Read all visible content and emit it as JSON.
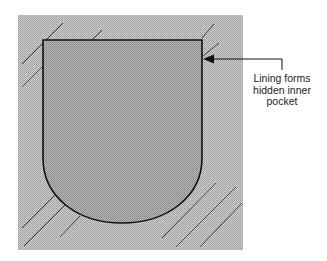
{
  "diagram": {
    "type": "pocket-cross-section",
    "colors": {
      "background_fabric": "#c4c4c4",
      "pocket_fill": "#a6a6a6",
      "outline": "#111111",
      "hatch": "#333333"
    },
    "callout": {
      "lines": [
        "Lining forms",
        "hidden inner",
        "pocket"
      ]
    }
  }
}
